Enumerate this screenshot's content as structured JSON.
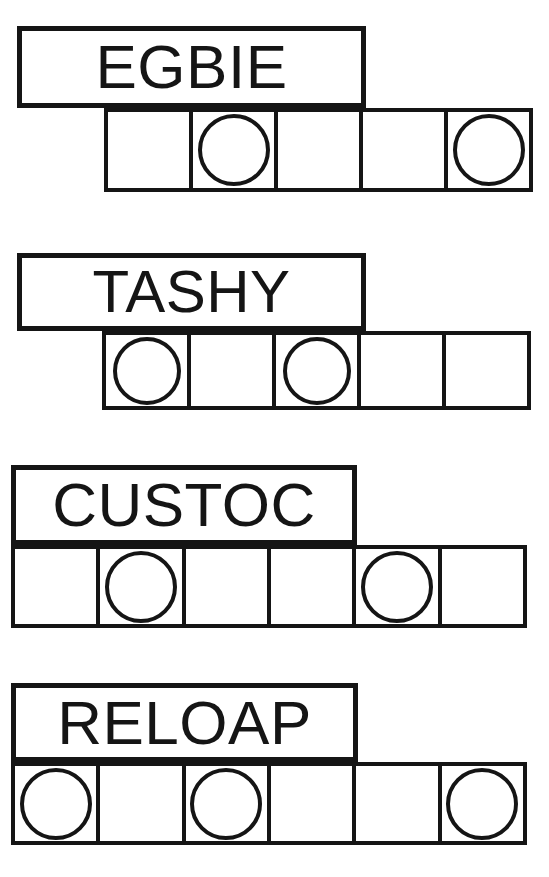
{
  "sheet": {
    "width": 549,
    "height": 877,
    "background": "#ffffff",
    "ink_color": "#151515",
    "description": "Word puzzle worksheet: four word labels, each above a row of empty answer boxes with some boxes marked by circles."
  },
  "puzzles": [
    {
      "id": "puzzle-1",
      "word": "EGBIE",
      "letter_count": 5,
      "cell_count": 5,
      "circled_cells": [
        2,
        5
      ],
      "label_box": {
        "x": 17,
        "y": 26,
        "width": 349,
        "height": 82,
        "font_size": 62
      },
      "grid": {
        "x": 104,
        "y": 108,
        "width": 429,
        "height": 84,
        "circle_size": 72
      },
      "cells": [
        {
          "index": 1,
          "circled": false
        },
        {
          "index": 2,
          "circled": true
        },
        {
          "index": 3,
          "circled": false
        },
        {
          "index": 4,
          "circled": false
        },
        {
          "index": 5,
          "circled": true
        }
      ]
    },
    {
      "id": "puzzle-2",
      "word": "TASHY",
      "letter_count": 5,
      "cell_count": 5,
      "circled_cells": [
        1,
        3
      ],
      "label_box": {
        "x": 17,
        "y": 253,
        "width": 349,
        "height": 78,
        "font_size": 60
      },
      "grid": {
        "x": 102,
        "y": 331,
        "width": 429,
        "height": 79,
        "circle_size": 68
      },
      "cells": [
        {
          "index": 1,
          "circled": true
        },
        {
          "index": 2,
          "circled": false
        },
        {
          "index": 3,
          "circled": true
        },
        {
          "index": 4,
          "circled": false
        },
        {
          "index": 5,
          "circled": false
        }
      ]
    },
    {
      "id": "puzzle-3",
      "word": "CUSTOC",
      "letter_count": 6,
      "cell_count": 6,
      "circled_cells": [
        2,
        5
      ],
      "label_box": {
        "x": 11,
        "y": 465,
        "width": 346,
        "height": 80,
        "font_size": 62
      },
      "grid": {
        "x": 11,
        "y": 545,
        "width": 516,
        "height": 83,
        "circle_size": 72
      },
      "cells": [
        {
          "index": 1,
          "circled": false
        },
        {
          "index": 2,
          "circled": true
        },
        {
          "index": 3,
          "circled": false
        },
        {
          "index": 4,
          "circled": false
        },
        {
          "index": 5,
          "circled": true
        },
        {
          "index": 6,
          "circled": false
        }
      ]
    },
    {
      "id": "puzzle-4",
      "word": "RELOAP",
      "letter_count": 6,
      "cell_count": 6,
      "circled_cells": [
        1,
        3,
        6
      ],
      "label_box": {
        "x": 11,
        "y": 683,
        "width": 347,
        "height": 79,
        "font_size": 62
      },
      "grid": {
        "x": 11,
        "y": 762,
        "width": 516,
        "height": 83,
        "circle_size": 72
      },
      "cells": [
        {
          "index": 1,
          "circled": true
        },
        {
          "index": 2,
          "circled": false
        },
        {
          "index": 3,
          "circled": true
        },
        {
          "index": 4,
          "circled": false
        },
        {
          "index": 5,
          "circled": false
        },
        {
          "index": 6,
          "circled": true
        }
      ]
    }
  ]
}
